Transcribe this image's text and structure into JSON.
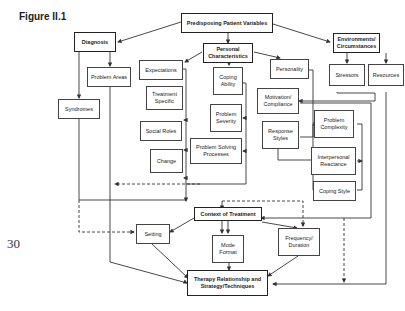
{
  "figure": {
    "title": "Figure II.1",
    "page_number": "30"
  },
  "nodes": {
    "predisposing": "Predisposing Patient Variables",
    "diagnosis": "Diagnosis",
    "problem_areas": "Problem Areas",
    "syndromes": "Syndromes",
    "personal_characteristics": "Personal Characteristics",
    "expectations": "Expectations",
    "treatment_specific": "Treatment Specific",
    "social_roles": "Social Roles",
    "change": "Change",
    "coping_ability": "Coping Ability",
    "problem_severity": "Problem Severity",
    "problem_solving": "Problem Solving Processes",
    "personality": "Personality",
    "motivation": "Motivation/ Compliance",
    "response_styles": "Response Styles",
    "problem_complexity": "Problem Complexity",
    "interpersonal_reactance": "Interpersonal Reactance",
    "coping_style": "Coping Style",
    "environments": "Environments/ Circumstances",
    "stressors": "Stressors",
    "resources": "Resources",
    "context": "Context of Treatment",
    "setting": "Setting",
    "mode_format": "Mode Format",
    "frequency": "Frequency/ Duration",
    "therapy": "Therapy Relationship and Strategy/Techniques"
  }
}
